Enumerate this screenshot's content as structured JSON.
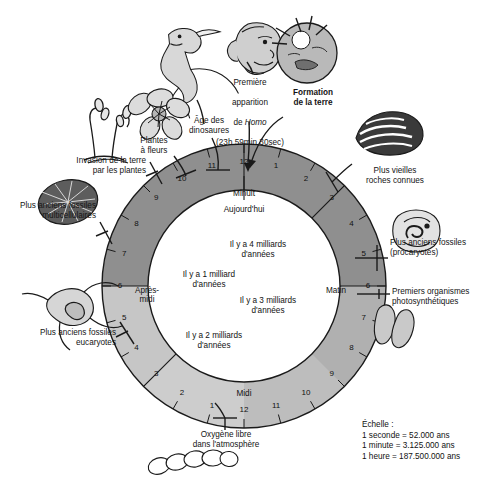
{
  "figure": {
    "type": "diagram",
    "language": "fr"
  },
  "outer_labels": [
    {
      "id": "age-des-dinosaures",
      "text": "Âge des\ndinosaures",
      "bold": false
    },
    {
      "id": "premiere-apparition-homo-line1",
      "text": "Première",
      "bold": false
    },
    {
      "id": "premiere-apparition-homo-line2",
      "text": "apparition",
      "bold": false
    },
    {
      "id": "premiere-apparition-homo-line3-pre",
      "text": "de ",
      "bold": false
    },
    {
      "id": "premiere-apparition-homo-line3-italic",
      "text": "Homo",
      "bold": false
    },
    {
      "id": "premiere-apparition-homo-line4",
      "text": "(23h 59min 30sec)",
      "bold": false
    },
    {
      "id": "formation-de-la-terre",
      "text": "Formation\nde la terre",
      "bold": true
    },
    {
      "id": "plus-vieilles-roches-connues",
      "text": "Plus vieilles\nroches connues",
      "bold": false
    },
    {
      "id": "plus-anciens-fossiles-procaryotes",
      "text": "Plus anciens fossiles\n(procaryotes)",
      "bold": false
    },
    {
      "id": "premiers-organismes-photosynthetiques",
      "text": "Premiers organismes\nphotosynthétiques",
      "bold": false
    },
    {
      "id": "oxygene-libre-dans-atmosphere",
      "text": "Oxygène libre\ndans l'atmosphère",
      "bold": false
    },
    {
      "id": "plus-anciens-fossiles-eucaryotes",
      "text": "Plus anciens fossiles\neucaryotes",
      "bold": false
    },
    {
      "id": "plus-anciens-fossiles-multicellulaires",
      "text": "Plus anciens fossiles\nmulticellulaires",
      "bold": false
    },
    {
      "id": "invasion-de-la-terre-par-les-plantes",
      "text": "Invasion de la terre\npar les plantes",
      "bold": false
    },
    {
      "id": "plantes-a-fleurs",
      "text": "Plantes\nà fleurs",
      "bold": false
    }
  ],
  "labels": {
    "age_dinosaures": "Âge des\ndinosaures",
    "homo_l1": "Première",
    "homo_l2": "apparition",
    "homo_de": "de ",
    "homo_italic": "Homo",
    "homo_time": "(23h 59min 30sec)",
    "formation_terre": "Formation\nde la terre",
    "vieilles_roches": "Plus vieilles\nroches connues",
    "fossiles_procaryotes": "Plus anciens fossiles\n(procaryotes)",
    "photosynthetiques": "Premiers organismes\nphotosynthétiques",
    "oxygene": "Oxygène libre\ndans l'atmosphère",
    "fossiles_eucaryotes": "Plus anciens fossiles\neucaryotes",
    "fossiles_multicellulaires": "Plus anciens fossiles\nmulticellulaires",
    "invasion_plantes": "Invasion de la terre\npar les plantes",
    "plantes_fleurs": "Plantes\nà fleurs"
  },
  "ring": {
    "periods": [
      {
        "label": "Minuit",
        "angle_deg": 0
      },
      {
        "label": "Matin",
        "angle_deg": 90
      },
      {
        "label": "Midi",
        "angle_deg": 180
      },
      {
        "label": "Après-\nmidi",
        "angle_deg": 270
      }
    ],
    "hour_marks": [
      {
        "n": "12",
        "angle_deg": 0
      },
      {
        "n": "1",
        "angle_deg": 15
      },
      {
        "n": "2",
        "angle_deg": 30
      },
      {
        "n": "3",
        "angle_deg": 45
      },
      {
        "n": "4",
        "angle_deg": 60
      },
      {
        "n": "5",
        "angle_deg": 75
      },
      {
        "n": "6",
        "angle_deg": 90
      },
      {
        "n": "7",
        "angle_deg": 105
      },
      {
        "n": "8",
        "angle_deg": 120
      },
      {
        "n": "9",
        "angle_deg": 135
      },
      {
        "n": "10",
        "angle_deg": 150
      },
      {
        "n": "11",
        "angle_deg": 165
      },
      {
        "n": "12",
        "angle_deg": 180
      },
      {
        "n": "1",
        "angle_deg": 195
      },
      {
        "n": "2",
        "angle_deg": 210
      },
      {
        "n": "3",
        "angle_deg": 225
      },
      {
        "n": "4",
        "angle_deg": 240
      },
      {
        "n": "5",
        "angle_deg": 255
      },
      {
        "n": "6",
        "angle_deg": 270
      },
      {
        "n": "7",
        "angle_deg": 285
      },
      {
        "n": "8",
        "angle_deg": 300
      },
      {
        "n": "9",
        "angle_deg": 315
      },
      {
        "n": "10",
        "angle_deg": 330
      },
      {
        "n": "11",
        "angle_deg": 345
      }
    ],
    "segment_dividers_deg": [
      0,
      45,
      90,
      225,
      270
    ],
    "colors": {
      "dark": "#8f8f8f",
      "mid": "#b3b3b3",
      "light": "#cfcfcf",
      "inner": "#ffffff",
      "stroke": "#1a1a1a"
    }
  },
  "inner_labels": [
    {
      "id": "aujourdhui",
      "text": "Aujourd'hui"
    },
    {
      "id": "4-milliards",
      "text": "Il y a 4 milliards\nd'années"
    },
    {
      "id": "3-milliards",
      "text": "Il y a 3 milliards\nd'années"
    },
    {
      "id": "2-milliards",
      "text": "Il y a 2 milliards\nd'années"
    },
    {
      "id": "1-milliard",
      "text": "Il y a 1 milliard\nd'années"
    }
  ],
  "inner": {
    "aujourdhui": "Aujourd'hui",
    "quatre": "Il y a 4 milliards\nd'années",
    "trois": "Il y a 3 milliards\nd'années",
    "deux": "Il y a 2 milliards\nd'années",
    "un": "Il y a 1 milliard\nd'années"
  },
  "scale": {
    "title": "Échelle :",
    "lines": [
      "1 seconde = 52.000 ans",
      "1 minute = 3.125.000 ans",
      "1 heure = 187.500.000 ans"
    ],
    "l1": "1 seconde = 52.000 ans",
    "l2": "1 minute = 3.125.000 ans",
    "l3": "1 heure = 187.500.000 ans"
  },
  "illustrations": [
    {
      "id": "dinosaur-icon",
      "name": "dinosaur-illustration"
    },
    {
      "id": "hominid-head-icon",
      "name": "hominid-head-illustration"
    },
    {
      "id": "earth-formation-icon",
      "name": "earth-formation-illustration"
    },
    {
      "id": "stromatolite-rock-icon",
      "name": "oldest-rocks-illustration"
    },
    {
      "id": "prokaryote-cell-icon",
      "name": "prokaryote-fossil-illustration"
    },
    {
      "id": "photosynthetic-bacteria-icon",
      "name": "photosynthetic-organisms-illustration"
    },
    {
      "id": "cyanobacteria-chain-icon",
      "name": "free-oxygen-illustration"
    },
    {
      "id": "eukaryote-cell-icon",
      "name": "eukaryote-fossil-illustration"
    },
    {
      "id": "multicellular-fossil-icon",
      "name": "multicellular-fossil-illustration"
    },
    {
      "id": "land-plant-icon",
      "name": "land-plant-illustration"
    },
    {
      "id": "flower-icon",
      "name": "flowering-plant-illustration"
    }
  ]
}
